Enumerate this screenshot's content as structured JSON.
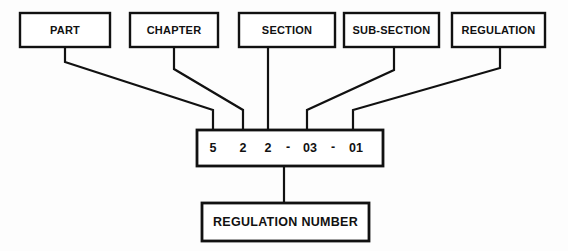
{
  "diagram": {
    "background_color": "#fdfdfd",
    "line_color": "#111111",
    "box_fill_color": "#ffffff",
    "component_boxes": [
      {
        "id": "part",
        "label": "PART"
      },
      {
        "id": "chapter",
        "label": "CHAPTER"
      },
      {
        "id": "section",
        "label": "SECTION"
      },
      {
        "id": "sub-section",
        "label": "SUB-SECTION"
      },
      {
        "id": "regulation",
        "label": "REGULATION"
      }
    ],
    "code_box": {
      "full_code": "5 2 2 - 03 - 01",
      "tokens": [
        {
          "id": "part-digit",
          "text": "5"
        },
        {
          "id": "chapter-digit",
          "text": "2"
        },
        {
          "id": "section-digit",
          "text": "2"
        },
        {
          "id": "separator-1",
          "text": "-"
        },
        {
          "id": "sub-section-digits",
          "text": "03"
        },
        {
          "id": "separator-2",
          "text": "-"
        },
        {
          "id": "regulation-digits",
          "text": "01"
        }
      ]
    },
    "result_box": {
      "label": "REGULATION NUMBER"
    }
  }
}
